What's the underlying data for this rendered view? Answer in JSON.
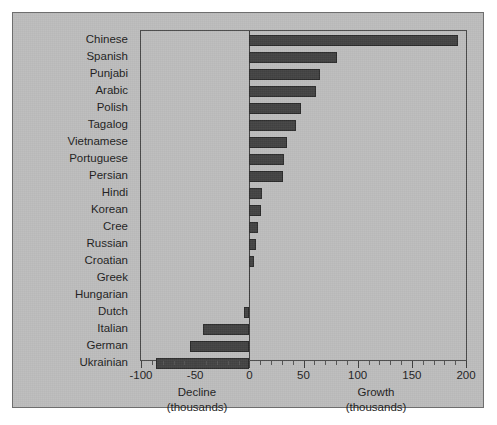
{
  "chart_data": {
    "type": "bar",
    "orientation": "horizontal",
    "title": "",
    "xlabel": "",
    "ylabel": "",
    "xlim": [
      -100,
      200
    ],
    "xticks": [
      -100,
      -50,
      0,
      50,
      100,
      150,
      200
    ],
    "xtick_labels": [
      "-100",
      "-50",
      "0",
      "50",
      "100",
      "150",
      "200"
    ],
    "grid": false,
    "legend": null,
    "units": "thousands",
    "bar_color": "#434343",
    "background_color": "#bdbdbd",
    "categories": [
      "Chinese",
      "Spanish",
      "Punjabi",
      "Arabic",
      "Polish",
      "Tagalog",
      "Vietnamese",
      "Portuguese",
      "Persian",
      "Hindi",
      "Korean",
      "Cree",
      "Russian",
      "Croatian",
      "Greek",
      "Hungarian",
      "Dutch",
      "Italian",
      "German",
      "Ukrainian"
    ],
    "values": [
      193,
      81,
      65,
      62,
      48,
      43,
      35,
      32,
      31,
      12,
      11,
      8,
      6,
      4,
      0,
      0,
      -5,
      -43,
      -55,
      -86
    ],
    "axis_captions": {
      "left": {
        "name": "Decline",
        "unit": "(thousands)"
      },
      "right": {
        "name": "Growth",
        "unit": "(thousands)"
      }
    }
  }
}
